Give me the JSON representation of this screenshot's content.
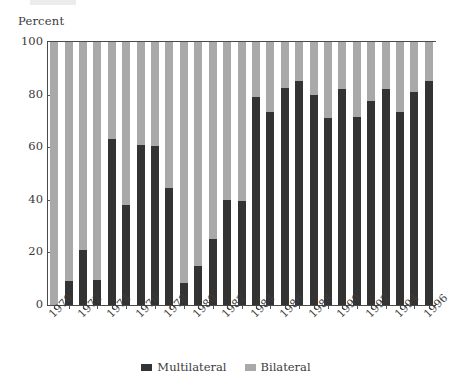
{
  "axis_title": "Percent",
  "colors": {
    "multilateral": "#333333",
    "bilateral": "#a9a9a9",
    "axis": "#4a4a4a",
    "text": "#3b3b3b",
    "background": "#ffffff"
  },
  "legend": {
    "items": [
      {
        "label": "Multilateral",
        "swatch": "dark-square-swatch",
        "color": "#333333"
      },
      {
        "label": "Bilateral",
        "swatch": "light-square-swatch",
        "color": "#a9a9a9"
      }
    ]
  },
  "y_axis": {
    "label": "Percent",
    "ticks": [
      0,
      20,
      40,
      60,
      80,
      100
    ],
    "tick_labels": [
      "0",
      "20",
      "40",
      "60",
      "80",
      "100"
    ],
    "min": 0,
    "max": 100
  },
  "x_axis": {
    "tick_labels": [
      "1970",
      "1972",
      "1974",
      "1976",
      "1978",
      "1980",
      "1982",
      "1984",
      "1986",
      "1988",
      "1990",
      "1992",
      "1994",
      "1996"
    ],
    "all_categories": [
      "1970",
      "1971",
      "1972",
      "1973",
      "1974",
      "1975",
      "1976",
      "1977",
      "1978",
      "1979",
      "1980",
      "1981",
      "1982",
      "1983",
      "1984",
      "1985",
      "1986",
      "1987",
      "1988",
      "1989",
      "1990",
      "1991",
      "1992",
      "1993",
      "1994",
      "1995",
      "1996"
    ],
    "label_rotation": -45
  },
  "chart_data": {
    "type": "bar",
    "subtype": "stacked-100-percent",
    "title": "",
    "subtitle": "",
    "xlabel": "",
    "ylabel": "Percent",
    "ylim": [
      0,
      100
    ],
    "grid": false,
    "legend_position": "bottom-center",
    "categories": [
      "1970",
      "1971",
      "1972",
      "1973",
      "1974",
      "1975",
      "1976",
      "1977",
      "1978",
      "1979",
      "1980",
      "1981",
      "1982",
      "1983",
      "1984",
      "1985",
      "1986",
      "1987",
      "1988",
      "1989",
      "1990",
      "1991",
      "1992",
      "1993",
      "1994",
      "1995",
      "1996"
    ],
    "series": [
      {
        "name": "Multilateral",
        "color": "#333333",
        "values": [
          0,
          9,
          21,
          9.5,
          63,
          38,
          61,
          60.5,
          44.5,
          8.5,
          15,
          25,
          40,
          39.5,
          79,
          73.5,
          82.5,
          85,
          80,
          71,
          82,
          71.5,
          77.5,
          82,
          73.5,
          81,
          85
        ]
      },
      {
        "name": "Bilateral",
        "color": "#a9a9a9",
        "values": [
          100,
          91,
          79,
          90.5,
          37,
          62,
          39,
          39.5,
          55.5,
          91.5,
          85,
          75,
          60,
          60.5,
          21,
          26.5,
          17.5,
          15,
          20,
          29,
          18,
          28.5,
          22.5,
          18,
          26.5,
          19,
          15
        ]
      }
    ]
  }
}
